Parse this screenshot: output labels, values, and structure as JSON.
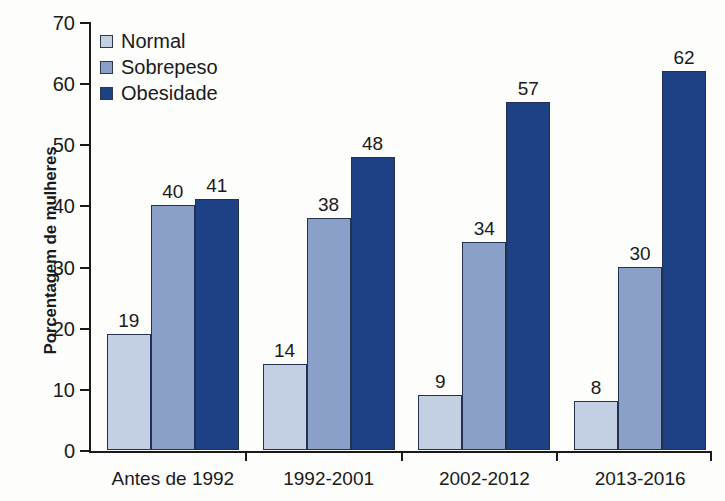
{
  "chart_data": {
    "type": "bar",
    "title": "",
    "xlabel": "",
    "ylabel": "Porcentagem de mulheres",
    "ylim": [
      0,
      70
    ],
    "ytick_step": 10,
    "yticks": [
      0,
      10,
      20,
      30,
      40,
      50,
      60,
      70
    ],
    "grid": false,
    "legend_position": "top-left",
    "categories": [
      "Antes de 1992",
      "1992-2001",
      "2002-2012",
      "2013-2016"
    ],
    "series": [
      {
        "name": "Normal",
        "color": "#c3cfe3",
        "values": [
          19,
          14,
          9,
          8
        ]
      },
      {
        "name": "Sobrepeso",
        "color": "#8ba0c8",
        "values": [
          40,
          38,
          34,
          30
        ]
      },
      {
        "name": "Obesidade",
        "color": "#1e4186",
        "values": [
          41,
          48,
          57,
          62
        ]
      }
    ]
  },
  "colors": {
    "background": "#fdfdfb",
    "axis": "#1a1a1a",
    "text": "#1a1a1a",
    "bar_outline": "#20324f",
    "normal": "#c3cfe3",
    "sobrepeso": "#8ba0c8",
    "obesidade": "#1e4186"
  }
}
